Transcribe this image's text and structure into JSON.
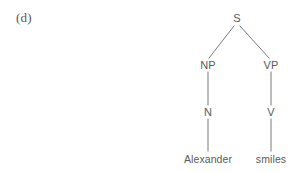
{
  "figure": {
    "item_label": "(d)",
    "caption": "",
    "background_color": "#ffffff",
    "line_color": "#7a7a7a",
    "text_color": "#5a5a5a"
  },
  "tree": {
    "type": "syntax-tree",
    "sentence": "Alexander smiles",
    "nodes": [
      {
        "id": "s",
        "label": "S",
        "x": 237,
        "y": 18,
        "level": 0,
        "kind": "phrase"
      },
      {
        "id": "np",
        "label": "NP",
        "x": 208,
        "y": 65,
        "level": 1,
        "kind": "phrase"
      },
      {
        "id": "vp",
        "label": "VP",
        "x": 271,
        "y": 65,
        "level": 1,
        "kind": "phrase"
      },
      {
        "id": "n",
        "label": "N",
        "x": 208,
        "y": 112,
        "level": 2,
        "kind": "word-class"
      },
      {
        "id": "v",
        "label": "V",
        "x": 271,
        "y": 112,
        "level": 2,
        "kind": "word-class"
      },
      {
        "id": "alexander",
        "label": "Alexander",
        "x": 208,
        "y": 159,
        "level": 3,
        "kind": "leaf"
      },
      {
        "id": "smiles",
        "label": "smiles",
        "x": 271,
        "y": 159,
        "level": 3,
        "kind": "leaf"
      }
    ],
    "edges": [
      {
        "id": "s-np",
        "from": "s",
        "to": "np",
        "x1": 234,
        "y1": 26,
        "x2": 209,
        "y2": 58
      },
      {
        "id": "s-vp",
        "from": "s",
        "to": "vp",
        "x1": 240,
        "y1": 26,
        "x2": 269,
        "y2": 58
      },
      {
        "id": "np-n",
        "from": "np",
        "to": "n",
        "x1": 208,
        "y1": 72,
        "x2": 208,
        "y2": 105
      },
      {
        "id": "vp-v",
        "from": "vp",
        "to": "v",
        "x1": 271,
        "y1": 72,
        "x2": 271,
        "y2": 105
      },
      {
        "id": "n-word",
        "from": "n",
        "to": "alexander",
        "x1": 208,
        "y1": 119,
        "x2": 208,
        "y2": 151
      },
      {
        "id": "v-word",
        "from": "v",
        "to": "smiles",
        "x1": 271,
        "y1": 119,
        "x2": 271,
        "y2": 151
      }
    ]
  }
}
